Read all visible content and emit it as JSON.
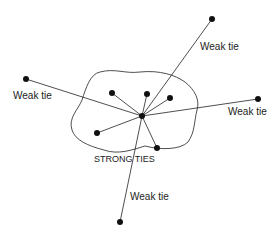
{
  "diagram": {
    "center": {
      "x": 142,
      "y": 116
    },
    "weak_nodes": [
      {
        "x": 212,
        "y": 19
      },
      {
        "x": 26,
        "y": 79
      },
      {
        "x": 258,
        "y": 99
      },
      {
        "x": 120,
        "y": 222
      }
    ],
    "strong_nodes": [
      {
        "x": 112,
        "y": 93
      },
      {
        "x": 147,
        "y": 94
      },
      {
        "x": 170,
        "y": 98
      },
      {
        "x": 97,
        "y": 133
      },
      {
        "x": 157,
        "y": 148
      }
    ],
    "labels": {
      "weak_top": "Weak tie",
      "weak_left": "Weak tie",
      "weak_right": "Weak tie",
      "weak_bottom": "Weak tie",
      "strong": "STRONG TIES"
    }
  }
}
